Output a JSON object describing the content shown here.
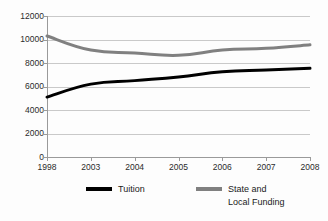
{
  "chart_data": {
    "type": "line",
    "title": "",
    "xlabel": "",
    "ylabel": "",
    "categories": [
      "1998",
      "2003",
      "2004",
      "2005",
      "2006",
      "2007",
      "2008"
    ],
    "ylim": [
      0,
      12000
    ],
    "yticks": [
      0,
      2000,
      4000,
      6000,
      8000,
      10000,
      12000
    ],
    "ytick_labels": [
      "0",
      "2000",
      "4000",
      "6000",
      "8000",
      "10000",
      "12000"
    ],
    "grid": true,
    "legend_position": "bottom",
    "series": [
      {
        "name": "Tuition",
        "color": "#000000",
        "values": [
          5100,
          6200,
          6500,
          6800,
          7250,
          7400,
          7550
        ]
      },
      {
        "name": "State and\nLocal Funding",
        "color": "#808080",
        "values": [
          10300,
          9100,
          8850,
          8650,
          9100,
          9250,
          9550
        ]
      }
    ]
  },
  "legend": {
    "entries": [
      {
        "label": "Tuition"
      },
      {
        "label": "State and\nLocal Funding"
      }
    ]
  },
  "colors": {
    "tuition": "#000000",
    "funding": "#808080",
    "gridline": "#c9c9c9",
    "axis": "#9a9a9a",
    "background": "#fdfdfd",
    "text": "#2b2b2b"
  }
}
